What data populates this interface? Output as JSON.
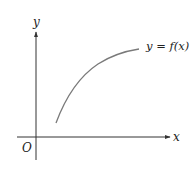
{
  "diagram": {
    "type": "function-graph",
    "axes": {
      "x_label": "x",
      "y_label": "y",
      "origin_label": "O"
    },
    "curve": {
      "label": "y = f(x)",
      "description": "increasing, concave-down curve in the first quadrant",
      "color": "#7a7a7a"
    },
    "colors": {
      "axis": "#333333",
      "text": "#222222",
      "background": "#ffffff"
    }
  }
}
